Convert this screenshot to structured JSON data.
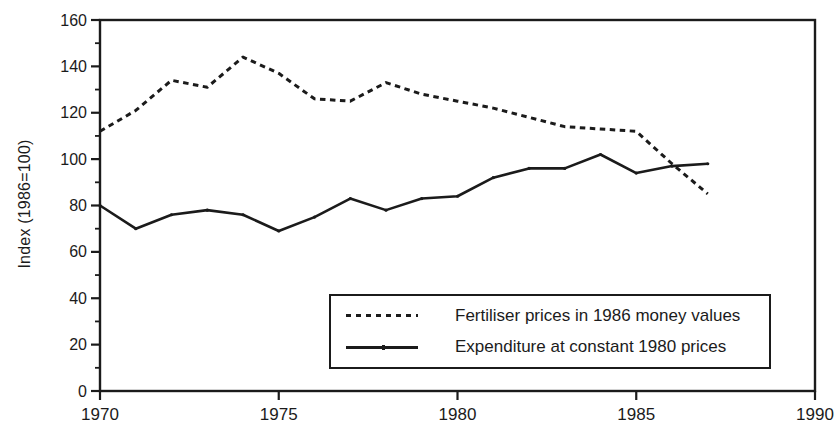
{
  "chart_data": {
    "type": "line",
    "title": "",
    "xlabel": "",
    "ylabel": "Index (1986=100)",
    "xlim": [
      1970,
      1990
    ],
    "ylim": [
      0,
      160
    ],
    "x_ticks": [
      1970,
      1975,
      1980,
      1985,
      1990
    ],
    "y_ticks": [
      0,
      20,
      40,
      60,
      80,
      100,
      120,
      140,
      160
    ],
    "y_minor_step": 10,
    "grid": false,
    "frame": true,
    "legend_position": "inside lower right",
    "ink_color": "#1b1b1b",
    "background_color": "#ffffff",
    "x": [
      1970,
      1971,
      1972,
      1973,
      1974,
      1975,
      1976,
      1977,
      1978,
      1979,
      1980,
      1981,
      1982,
      1983,
      1984,
      1985,
      1986,
      1987
    ],
    "series": [
      {
        "name": "Fertiliser prices in 1986 money values",
        "style": "dashed",
        "values": [
          112,
          121,
          134,
          131,
          144,
          137,
          126,
          125,
          133,
          128,
          125,
          122,
          118,
          114,
          113,
          112,
          98,
          85
        ]
      },
      {
        "name": "Expenditure at constant 1980 prices",
        "style": "solid",
        "values": [
          80,
          70,
          76,
          78,
          76,
          69,
          75,
          83,
          78,
          83,
          84,
          92,
          96,
          96,
          102,
          94,
          97,
          98
        ]
      }
    ]
  }
}
